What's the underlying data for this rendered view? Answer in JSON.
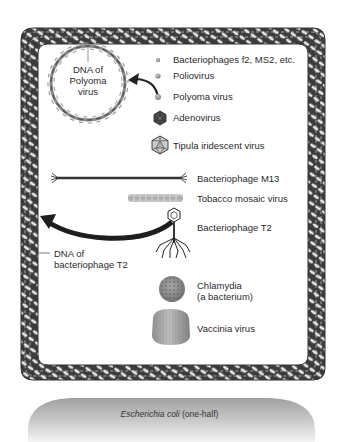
{
  "figure": {
    "type": "size-comparison-diagram",
    "container": "Escherichia coli (one-half)",
    "container_label": {
      "italic": "Escherichia coli",
      "rest": " (one-half)"
    },
    "border": "DNA of bacteriophage T2",
    "callouts": {
      "polyoma_dna": [
        "DNA of",
        "Polyoma",
        "virus"
      ],
      "t2_dna": [
        "DNA of",
        "bacteriophage T2"
      ]
    },
    "items": [
      {
        "label": "Bacteriophages f2, MS2, etc.",
        "icon": "tiny-sphere-icon"
      },
      {
        "label": "Poliovirus",
        "icon": "small-sphere-icon"
      },
      {
        "label": "Polyoma virus",
        "icon": "sphere-icon"
      },
      {
        "label": "Adenovirus",
        "icon": "icosahedron-dark-icon"
      },
      {
        "label": "Tipula iridescent virus",
        "icon": "icosahedron-light-icon"
      },
      {
        "label": "Bacteriophage M13",
        "icon": "filament-icon"
      },
      {
        "label": "Tobacco mosaic virus",
        "icon": "rod-icon"
      },
      {
        "label": "Bacteriophage T2",
        "icon": "tailed-phage-icon"
      },
      {
        "label": "Chlamydia",
        "sublabel": "(a bacterium)",
        "icon": "textured-sphere-icon"
      },
      {
        "label": "Vaccinia virus",
        "icon": "brick-virus-icon"
      }
    ],
    "colors": {
      "dna_dark": "#3a3a3a",
      "dna_light": "#bdbdbd",
      "virus_gray": "#8c8c8c",
      "ecoli_top": "#9a9a9a",
      "ecoli_bottom": "#f2f2f2"
    }
  }
}
